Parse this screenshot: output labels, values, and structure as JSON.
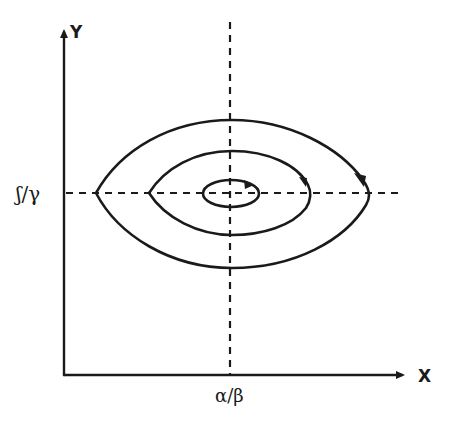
{
  "diagram": {
    "type": "phase-portrait",
    "axes": {
      "x_label": "x",
      "y_label": "y"
    },
    "equilibrium": {
      "x_tick_label": "α/β",
      "y_tick_label": "γ/δ (handwritten ʃ/γ)"
    },
    "labels": {
      "x_axis": "X",
      "y_axis": "Y",
      "x_equilibrium": "α/β",
      "y_equilibrium": "ʃ/γ"
    },
    "orbits": [
      {
        "name": "inner",
        "direction": "clockwise"
      },
      {
        "name": "middle",
        "direction": "clockwise"
      },
      {
        "name": "outer",
        "direction": "clockwise"
      }
    ],
    "colors": {
      "ink": "#1a1a1a",
      "background": "#ffffff"
    }
  }
}
